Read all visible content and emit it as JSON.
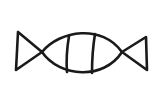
{
  "figure": {
    "description": "Hand-drawn line sketch of a wrapped candy shape",
    "stroke_color": "#1a1a1a",
    "background_color": "#ffffff",
    "stroke_width": 2.6,
    "parts": [
      "left-triangle-end",
      "central-lens-body",
      "left-inner-divider",
      "right-inner-divider",
      "right-triangle-end"
    ]
  }
}
